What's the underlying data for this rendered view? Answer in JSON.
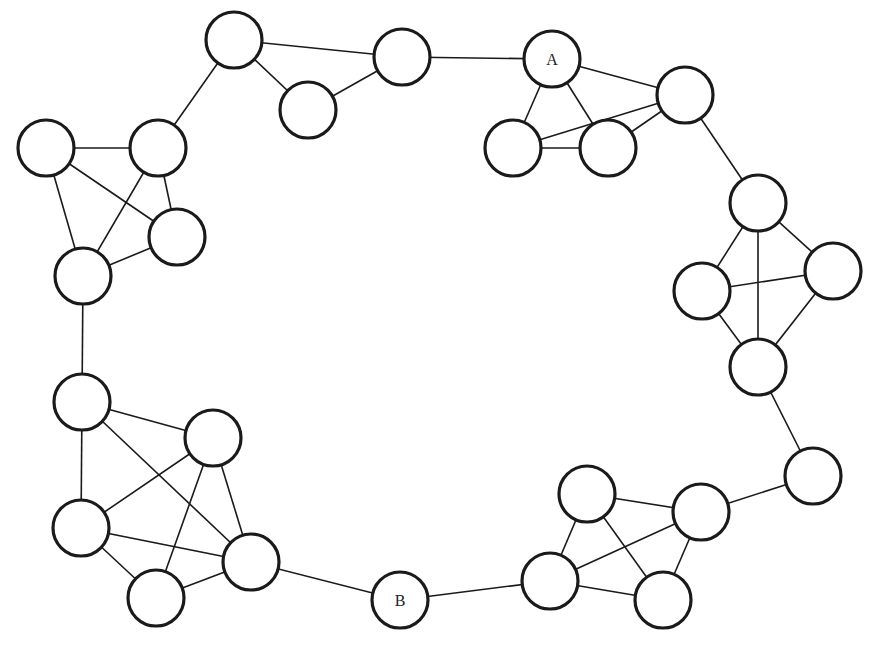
{
  "diagram": {
    "type": "network-graph",
    "node_radius": 28,
    "colors": {
      "stroke": "#1a1a1a",
      "fill": "#ffffff",
      "background": "#ffffff"
    },
    "nodes": [
      {
        "id": "n1",
        "label": "",
        "x": 234,
        "y": 40
      },
      {
        "id": "n2",
        "label": "",
        "x": 402,
        "y": 57
      },
      {
        "id": "n3",
        "label": "",
        "x": 308,
        "y": 110
      },
      {
        "id": "n4",
        "label": "",
        "x": 46,
        "y": 148
      },
      {
        "id": "n5",
        "label": "",
        "x": 158,
        "y": 148
      },
      {
        "id": "n6",
        "label": "",
        "x": 177,
        "y": 237
      },
      {
        "id": "n7",
        "label": "",
        "x": 83,
        "y": 276
      },
      {
        "id": "A",
        "label": "A",
        "x": 552,
        "y": 59
      },
      {
        "id": "n9",
        "label": "",
        "x": 685,
        "y": 95
      },
      {
        "id": "n10",
        "label": "",
        "x": 513,
        "y": 148
      },
      {
        "id": "n11",
        "label": "",
        "x": 608,
        "y": 148
      },
      {
        "id": "n12",
        "label": "",
        "x": 758,
        "y": 203
      },
      {
        "id": "n13",
        "label": "",
        "x": 702,
        "y": 291
      },
      {
        "id": "n14",
        "label": "",
        "x": 833,
        "y": 271
      },
      {
        "id": "n15",
        "label": "",
        "x": 758,
        "y": 367
      },
      {
        "id": "n16",
        "label": "",
        "x": 813,
        "y": 476
      },
      {
        "id": "n17",
        "label": "",
        "x": 587,
        "y": 494
      },
      {
        "id": "n18",
        "label": "",
        "x": 701,
        "y": 512
      },
      {
        "id": "n19",
        "label": "",
        "x": 550,
        "y": 581
      },
      {
        "id": "n20",
        "label": "",
        "x": 663,
        "y": 600
      },
      {
        "id": "B",
        "label": "B",
        "x": 400,
        "y": 600
      },
      {
        "id": "n22",
        "label": "",
        "x": 251,
        "y": 562
      },
      {
        "id": "n23",
        "label": "",
        "x": 156,
        "y": 598
      },
      {
        "id": "n24",
        "label": "",
        "x": 81,
        "y": 528
      },
      {
        "id": "n25",
        "label": "",
        "x": 213,
        "y": 438
      },
      {
        "id": "n26",
        "label": "",
        "x": 82,
        "y": 402
      }
    ],
    "edges": [
      [
        "n1",
        "n2"
      ],
      [
        "n1",
        "n3"
      ],
      [
        "n2",
        "n3"
      ],
      [
        "n1",
        "n5"
      ],
      [
        "n2",
        "A"
      ],
      [
        "n4",
        "n5"
      ],
      [
        "n4",
        "n6"
      ],
      [
        "n4",
        "n7"
      ],
      [
        "n5",
        "n6"
      ],
      [
        "n5",
        "n7"
      ],
      [
        "n6",
        "n7"
      ],
      [
        "A",
        "n9"
      ],
      [
        "A",
        "n10"
      ],
      [
        "A",
        "n11"
      ],
      [
        "n10",
        "n11"
      ],
      [
        "n10",
        "n9"
      ],
      [
        "n11",
        "n9"
      ],
      [
        "n9",
        "n12"
      ],
      [
        "n12",
        "n13"
      ],
      [
        "n12",
        "n14"
      ],
      [
        "n12",
        "n15"
      ],
      [
        "n13",
        "n14"
      ],
      [
        "n13",
        "n15"
      ],
      [
        "n14",
        "n15"
      ],
      [
        "n15",
        "n16"
      ],
      [
        "n16",
        "n18"
      ],
      [
        "n17",
        "n18"
      ],
      [
        "n17",
        "n19"
      ],
      [
        "n17",
        "n20"
      ],
      [
        "n18",
        "n19"
      ],
      [
        "n18",
        "n20"
      ],
      [
        "n19",
        "n20"
      ],
      [
        "n19",
        "B"
      ],
      [
        "B",
        "n22"
      ],
      [
        "n22",
        "n23"
      ],
      [
        "n22",
        "n24"
      ],
      [
        "n22",
        "n25"
      ],
      [
        "n22",
        "n26"
      ],
      [
        "n23",
        "n24"
      ],
      [
        "n23",
        "n25"
      ],
      [
        "n24",
        "n25"
      ],
      [
        "n24",
        "n26"
      ],
      [
        "n25",
        "n26"
      ],
      [
        "n7",
        "n26"
      ]
    ]
  }
}
